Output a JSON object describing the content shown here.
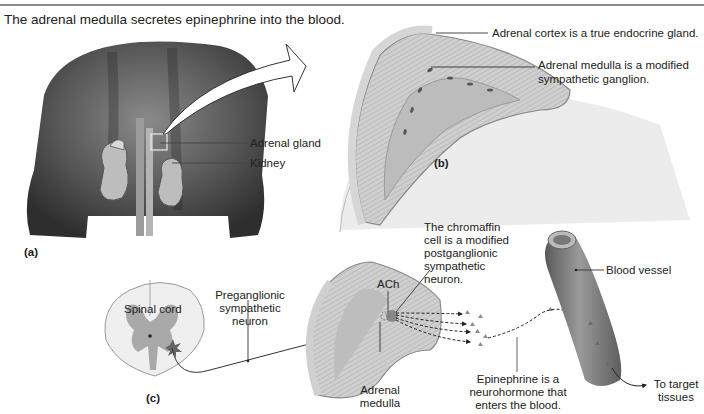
{
  "figure": {
    "title": "The adrenal medulla secretes epinephrine into the blood."
  },
  "panel_a": {
    "label": "(a)",
    "callouts": [
      "Adrenal gland",
      "Kidney"
    ]
  },
  "panel_b": {
    "label": "(b)",
    "callouts": [
      "Adrenal cortex is a true endocrine gland.",
      "Adrenal medulla is a modified",
      "sympathetic ganglion."
    ]
  },
  "panel_c": {
    "label": "(c)",
    "spinal_cord": "Spinal cord",
    "preganglionic": [
      "Preganglionic",
      "sympathetic",
      "neuron"
    ],
    "ach": "ACh",
    "chromaffin": [
      "The chromaffin",
      "cell is a modified",
      "postganglionic",
      "sympathetic",
      "neuron."
    ],
    "adrenal_medulla": [
      "Adrenal",
      "medulla"
    ],
    "epinephrine": [
      "Epinephrine is a",
      "neurohormone that",
      "enters the blood."
    ],
    "blood_vessel": "Blood vessel",
    "target": [
      "To target",
      "tissues"
    ]
  },
  "colors": {
    "skin_dark": "#3a3a3a",
    "skin_mid": "#6b6b6b",
    "gland_fill": "#c9c9c9",
    "gland_edge": "#9a9a9a",
    "vessel": "#7a7a7a",
    "hormone": "#8c8c8c"
  }
}
